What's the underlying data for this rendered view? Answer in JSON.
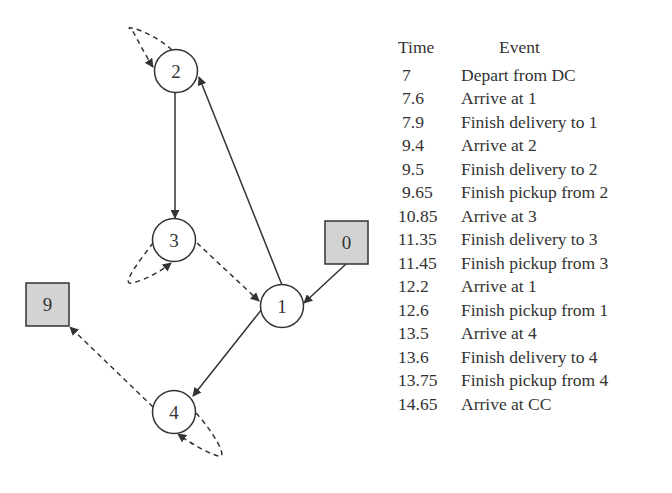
{
  "diagram": {
    "nodes": [
      {
        "id": "2",
        "shape": "circle",
        "cx": 176,
        "cy": 71
      },
      {
        "id": "3",
        "shape": "circle",
        "cx": 174,
        "cy": 240
      },
      {
        "id": "1",
        "shape": "circle",
        "cx": 282,
        "cy": 306
      },
      {
        "id": "4",
        "shape": "circle",
        "cx": 174,
        "cy": 412
      },
      {
        "id": "0",
        "shape": "square",
        "x": 325,
        "y": 221
      },
      {
        "id": "9",
        "shape": "square",
        "x": 26,
        "y": 283
      }
    ],
    "edges": [
      {
        "from": "0",
        "to": "1",
        "style": "solid"
      },
      {
        "from": "1",
        "to": "2",
        "style": "solid"
      },
      {
        "from": "2",
        "to": "2",
        "style": "dashed"
      },
      {
        "from": "2",
        "to": "3",
        "style": "solid"
      },
      {
        "from": "3",
        "to": "3",
        "style": "dashed"
      },
      {
        "from": "3",
        "to": "1",
        "style": "dashed"
      },
      {
        "from": "1",
        "to": "4",
        "style": "solid"
      },
      {
        "from": "4",
        "to": "4",
        "style": "dashed"
      },
      {
        "from": "4",
        "to": "9",
        "style": "dashed"
      }
    ],
    "colors": {
      "stroke": "#333333",
      "depot_fill": "#d3d3d3",
      "node_fill": "#ffffff"
    }
  },
  "table": {
    "headers": {
      "time": "Time",
      "event": "Event"
    },
    "rows": [
      {
        "time": "7",
        "event": "Depart from DC"
      },
      {
        "time": "7.6",
        "event": "Arrive at 1"
      },
      {
        "time": "7.9",
        "event": "Finish delivery to 1"
      },
      {
        "time": "9.4",
        "event": "Arrive at 2"
      },
      {
        "time": "9.5",
        "event": "Finish delivery to 2"
      },
      {
        "time": "9.65",
        "event": "Finish pickup from 2"
      },
      {
        "time": "10.85",
        "event": "Arrive at 3"
      },
      {
        "time": "11.35",
        "event": "Finish delivery to 3"
      },
      {
        "time": "11.45",
        "event": "Finish pickup from 3"
      },
      {
        "time": "12.2",
        "event": "Arrive at 1"
      },
      {
        "time": "12.6",
        "event": "Finish pickup from 1"
      },
      {
        "time": "13.5",
        "event": "Arrive at 4"
      },
      {
        "time": "13.6",
        "event": "Finish delivery to 4"
      },
      {
        "time": "13.75",
        "event": "Finish pickup from 4"
      },
      {
        "time": "14.65",
        "event": "Arrive at CC"
      }
    ]
  }
}
